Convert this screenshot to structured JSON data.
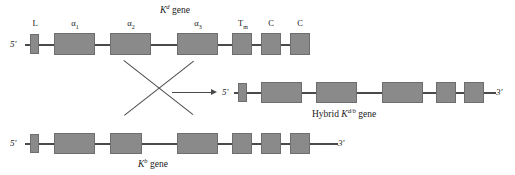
{
  "genes": {
    "kd": {
      "title_prefix": "",
      "title_main": "K",
      "title_sup": "d",
      "title_suffix": " gene",
      "five_prime": "5′",
      "three_prime": "3′",
      "exons": [
        {
          "label": "L",
          "sub": ""
        },
        {
          "label": "α",
          "sub": "1"
        },
        {
          "label": "α",
          "sub": "2"
        },
        {
          "label": "α",
          "sub": "3"
        },
        {
          "label": "T",
          "sub": "m"
        },
        {
          "label": "C",
          "sub": ""
        },
        {
          "label": "C",
          "sub": ""
        }
      ]
    },
    "kb": {
      "title_main": "K",
      "title_sup": "b",
      "title_suffix": " gene",
      "five_prime": "5′",
      "three_prime": "3′",
      "exon_count": 8
    },
    "hybrid": {
      "title_prefix": "Hybrid ",
      "title_main": "K",
      "title_sup": "d/b",
      "title_suffix": " gene",
      "five_prime": "5′",
      "three_prime": "3′",
      "exon_count": 7
    }
  },
  "colors": {
    "exon_fill": "#8a8a8a",
    "exon_stroke": "#6e6e6e",
    "line": "#4a4a4a",
    "text": "#1a1a1a",
    "background": "#ffffff"
  }
}
